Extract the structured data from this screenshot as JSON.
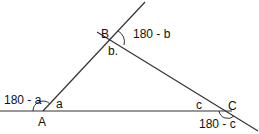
{
  "diagram": {
    "vertices": {
      "A": {
        "label": "A",
        "interior": "a",
        "exterior": "180 - a"
      },
      "B": {
        "label": "B",
        "interior": "b.",
        "exterior": "180 - b"
      },
      "C": {
        "label": "C",
        "interior": "c",
        "exterior": "180 - c"
      }
    },
    "colors": {
      "line": "#222222",
      "text": "#111111",
      "background": "#ffffff"
    }
  }
}
